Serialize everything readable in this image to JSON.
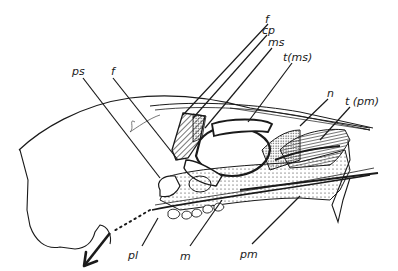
{
  "diagram": {
    "type": "anatomical line drawing",
    "colors": {
      "ink": "#1a1a1a",
      "background": "#ffffff"
    },
    "labels": [
      {
        "id": "f_top",
        "text": "f",
        "x": 265,
        "y": 14
      },
      {
        "id": "cp",
        "text": "cp",
        "x": 265,
        "y": 25
      },
      {
        "id": "ms",
        "text": "ms",
        "x": 269,
        "y": 38
      },
      {
        "id": "t_ms",
        "text": "t(ms)",
        "x": 283,
        "y": 53
      },
      {
        "id": "n",
        "text": "n",
        "x": 327,
        "y": 88
      },
      {
        "id": "t_pm",
        "text": "t (pm)",
        "x": 345,
        "y": 96
      },
      {
        "id": "ps",
        "text": "ps",
        "x": 72,
        "y": 66
      },
      {
        "id": "f_left",
        "text": "f",
        "x": 111,
        "y": 66
      },
      {
        "id": "pl",
        "text": "pl",
        "x": 128,
        "y": 251
      },
      {
        "id": "m",
        "text": "m",
        "x": 180,
        "y": 252
      },
      {
        "id": "pm",
        "text": "pm",
        "x": 240,
        "y": 249
      }
    ]
  }
}
